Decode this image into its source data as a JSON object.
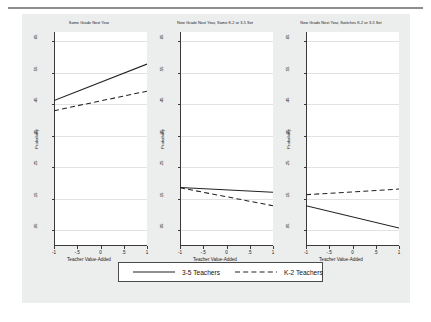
{
  "figure": {
    "background_color": "#eceded",
    "plot_background": "#ffffff",
    "line_color": "#222222",
    "gridline_color": "#e2e2e2"
  },
  "chart_data": {
    "type": "line",
    "title": "",
    "xlabel": "Teacher Value-Added",
    "ylabel": "Probability",
    "xlim": [
      -1,
      1
    ],
    "ylim": [
      0.0,
      0.68
    ],
    "xticks": [
      -1,
      -0.5,
      0,
      0.5,
      1
    ],
    "xticklabels": [
      "-1",
      "-.5",
      "0",
      ".5",
      "1"
    ],
    "yticks": [
      0.05,
      0.15,
      0.25,
      0.35,
      0.45,
      0.55,
      0.65
    ],
    "yticklabels": [
      ".05",
      ".15",
      ".25",
      ".35",
      ".45",
      ".55",
      ".65"
    ],
    "grid": true,
    "legend_position": "bottom-center",
    "legend": [
      {
        "name": "3-5 Teachers",
        "style": "solid"
      },
      {
        "name": "K-2 Teachers",
        "style": "dashed"
      }
    ],
    "panels": [
      {
        "title": "Same Grade Next Year",
        "series": [
          {
            "name": "3-5 Teachers",
            "style": "solid",
            "x": [
              -1,
              1
            ],
            "y": [
              0.462,
              0.578
            ]
          },
          {
            "name": "K-2 Teachers",
            "style": "dashed",
            "x": [
              -1,
              1
            ],
            "y": [
              0.43,
              0.492
            ]
          }
        ]
      },
      {
        "title": "New Grade Next Year, Same K-2 or 3-5 Set",
        "series": [
          {
            "name": "3-5 Teachers",
            "style": "solid",
            "x": [
              -1,
              1
            ],
            "y": [
              0.186,
              0.171
            ]
          },
          {
            "name": "K-2 Teachers",
            "style": "dashed",
            "x": [
              -1,
              1
            ],
            "y": [
              0.185,
              0.128
            ]
          }
        ]
      },
      {
        "title": "New Grade Next Year, Switches K-2 or 3-5 Set",
        "series": [
          {
            "name": "3-5 Teachers",
            "style": "solid",
            "x": [
              -1,
              1
            ],
            "y": [
              0.128,
              0.057
            ]
          },
          {
            "name": "K-2 Teachers",
            "style": "dashed",
            "x": [
              -1,
              1
            ],
            "y": [
              0.163,
              0.181
            ]
          }
        ]
      }
    ]
  }
}
